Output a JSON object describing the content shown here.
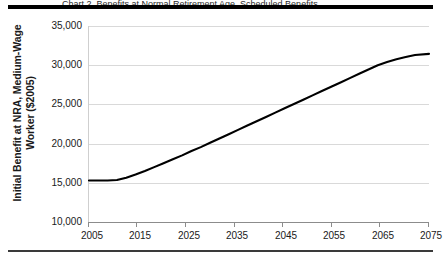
{
  "figure": {
    "caption_sliver": "Chart 2. Benefits at Normal Retirement Age, Scheduled Benefits",
    "background_color": "#ffffff",
    "line_color": "#000000",
    "gridline_color": "#d9d9d9",
    "axis_color": "#8c8c8c"
  },
  "axes": {
    "ylabel_line1": "Initial Benefit at NRA, Medium-Wage",
    "ylabel_line2": "Worker ($2005)",
    "xlabel": "",
    "yticks": [
      "35,000",
      "30,000",
      "25,000",
      "20,000",
      "15,000",
      "10,000"
    ],
    "xticks": [
      "2005",
      "2015",
      "2025",
      "2035",
      "2045",
      "2055",
      "2065",
      "2075"
    ]
  },
  "chart_data": {
    "type": "line",
    "title": "",
    "xlabel": "",
    "ylabel": "Initial Benefit at NRA, Medium-Wage Worker ($2005)",
    "xlim": [
      2005,
      2078
    ],
    "ylim": [
      10000,
      35000
    ],
    "ytick_values": [
      10000,
      15000,
      20000,
      25000,
      30000,
      35000
    ],
    "xtick_values": [
      2005,
      2015,
      2025,
      2035,
      2045,
      2055,
      2065,
      2075
    ],
    "grid": true,
    "legend": false,
    "series": [
      {
        "name": "Initial Benefit at NRA, Medium-Wage Worker",
        "x": [
          2005,
          2007,
          2009,
          2011,
          2013,
          2015,
          2017,
          2019,
          2021,
          2023,
          2025,
          2027,
          2029,
          2031,
          2033,
          2035,
          2037,
          2039,
          2041,
          2043,
          2045,
          2047,
          2049,
          2051,
          2053,
          2055,
          2057,
          2059,
          2061,
          2063,
          2065,
          2067,
          2069,
          2071,
          2073,
          2075,
          2078
        ],
        "y": [
          15300,
          15300,
          15300,
          15350,
          15650,
          16050,
          16500,
          17000,
          17500,
          18000,
          18500,
          19050,
          19550,
          20100,
          20650,
          21200,
          21750,
          22300,
          22850,
          23400,
          23950,
          24500,
          25050,
          25600,
          26150,
          26700,
          27250,
          27800,
          28350,
          28900,
          29450,
          30000,
          30400,
          30750,
          31050,
          31300,
          31450
        ]
      }
    ]
  }
}
